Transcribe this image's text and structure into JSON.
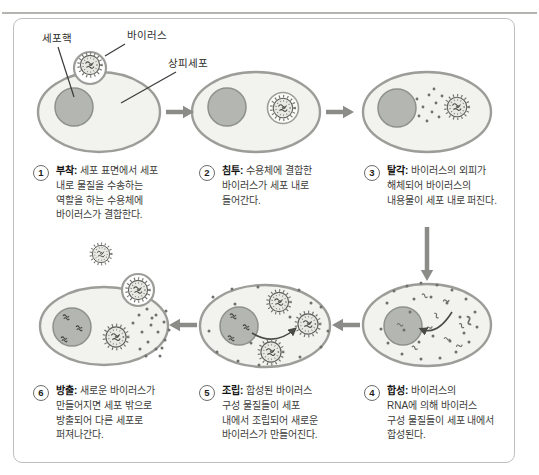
{
  "figure": {
    "labels": {
      "nucleus": "세포핵",
      "virus": "바이러스",
      "epithelial_cell": "상피세포"
    },
    "steps": [
      {
        "num": "1",
        "title": "부착:",
        "desc": "세포 표면에서 세포\n내로 물질을 수송하는\n역할을 하는 수용체에\n바이러스가 결합한다."
      },
      {
        "num": "2",
        "title": "침투:",
        "desc": "수용체에 결합한\n바이러스가 세포 내로\n들어간다."
      },
      {
        "num": "3",
        "title": "탈각:",
        "desc": "바이러스의 외피가\n해체되어 바이러스의\n내용물이 세포 내로 퍼진다."
      },
      {
        "num": "4",
        "title": "합성:",
        "desc": "바이러스의\nRNA에 의해 바이러스\n구성 물질들이 세포 내에서\n합성된다."
      },
      {
        "num": "5",
        "title": "조립:",
        "desc": "합성된 바이러스\n구성 물질들이 세포\n내에서 조립되어 새로운\n바이러스가 만들어진다."
      },
      {
        "num": "6",
        "title": "방출:",
        "desc": "새로운 바이러스가\n만들어지면 세포 밖으로\n방출되어 다른 세포로\n퍼져나간다."
      }
    ],
    "colors": {
      "cell_fill": "#f2f2ee",
      "cell_stroke": "#9c9c98",
      "nucleus_fill": "#b4b6b1",
      "nucleus_stroke": "#8e908b",
      "arrow": "#8b8b88",
      "debris": "#6f6f6b",
      "ink": "#3a3a38",
      "vesicle_fill": "#fbfbf8"
    }
  }
}
